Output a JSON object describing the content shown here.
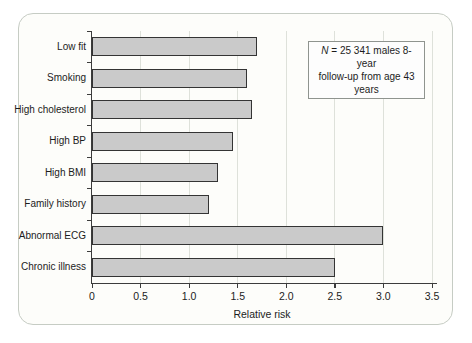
{
  "figure": {
    "annotation": {
      "n_symbol": "N",
      "line1_rest": " = 25 341 males 8-year",
      "line2": "follow-up from age 43 years"
    },
    "colors": {
      "bar_fill": "#cacaca",
      "bar_border": "#343434",
      "gridline": "#dee1da",
      "axis": "#3c3c3c",
      "card_border": "#c6ccc4",
      "card_bg": "#fdfdfa",
      "text": "#1c1c1c"
    }
  },
  "chart_data": {
    "type": "bar",
    "orientation": "horizontal",
    "title": "",
    "categories": [
      "Low fit",
      "Smoking",
      "High cholesterol",
      "High BP",
      "High BMI",
      "Family history",
      "Abnormal ECG",
      "Chronic illness"
    ],
    "values": [
      1.7,
      1.6,
      1.65,
      1.45,
      1.3,
      1.2,
      3.0,
      2.5
    ],
    "xlabel": "Relative risk",
    "ylabel": "",
    "xlim": [
      0,
      3.5
    ],
    "xticks": [
      0,
      0.5,
      1.0,
      1.5,
      2.0,
      2.5,
      3.0,
      3.5
    ],
    "xtick_labels": [
      "0",
      "0.5",
      "1.0",
      "1.5",
      "2.0",
      "2.5",
      "3.0",
      "3.5"
    ],
    "grid": "vertical gridlines at each 0.5 step",
    "legend": "none",
    "annotation_text": "N = 25 341 males 8-year follow-up from age 43 years"
  }
}
